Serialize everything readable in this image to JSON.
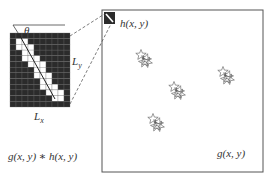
{
  "kernel": {
    "angle_label": "θ",
    "height_label_main": "L",
    "height_label_sub": "y",
    "width_label_main": "L",
    "width_label_sub": "x",
    "grid_cols": 10,
    "grid_rows": 13,
    "colors": {
      "dark": "#2b2b2b",
      "light": "#ffffff",
      "grid": "#6a6a6a"
    }
  },
  "formula": {
    "convolution_label": "g(x, y) ∗ h(x, y)"
  },
  "image_panel": {
    "kernel_thumbnail_label": "h(x, y)",
    "image_label": "g(x, y)",
    "stars": [
      {
        "x": 144,
        "y": 58
      },
      {
        "x": 177,
        "y": 90
      },
      {
        "x": 226,
        "y": 75
      },
      {
        "x": 156,
        "y": 122
      }
    ]
  }
}
